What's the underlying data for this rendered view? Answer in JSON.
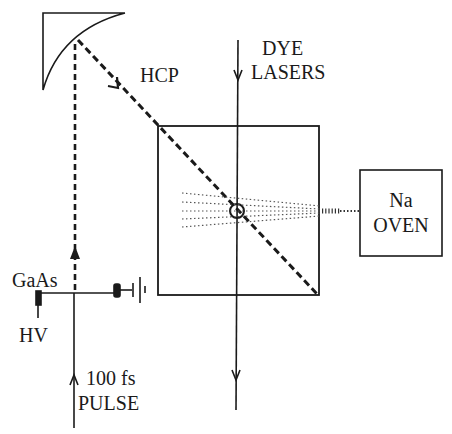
{
  "figure": {
    "type": "experimental-setup-schematic",
    "colors": {
      "ink": "#1a1a1a",
      "background": "#ffffff",
      "dotted": "#555555"
    }
  },
  "labels": {
    "hcp": "HCP",
    "dye_lasers_line1": "DYE",
    "dye_lasers_line2": "LASERS",
    "oven_line1": "Na",
    "oven_line2": "OVEN",
    "gaas": "GaAs",
    "hv": "HV",
    "pulse_line1": "100 fs",
    "pulse_line2": "PULSE"
  },
  "components": [
    {
      "id": "parabolic-mirror",
      "description": "Curved focusing mirror at top-left"
    },
    {
      "id": "interaction-chamber",
      "description": "Square chamber containing laser/atom interaction region"
    },
    {
      "id": "na-oven",
      "description": "Sodium oven producing atomic beam"
    },
    {
      "id": "gaas-emitter",
      "description": "GaAs photoconductive switch biased with HV"
    },
    {
      "id": "ground",
      "description": "Ground symbol connected to GaAs electrode"
    },
    {
      "id": "interaction-point",
      "description": "Circle marking beam intersection"
    }
  ],
  "beams": [
    {
      "id": "fs-pulse",
      "label": "100 fs PULSE",
      "style": "solid",
      "direction": "up"
    },
    {
      "id": "hcp-beam",
      "label": "HCP",
      "style": "dashed",
      "direction": "up then diagonal down-right"
    },
    {
      "id": "dye-lasers",
      "label": "DYE LASERS",
      "style": "solid",
      "direction": "down"
    },
    {
      "id": "atomic-beam",
      "label": "Na atomic beam",
      "style": "dotted",
      "direction": "left"
    }
  ]
}
